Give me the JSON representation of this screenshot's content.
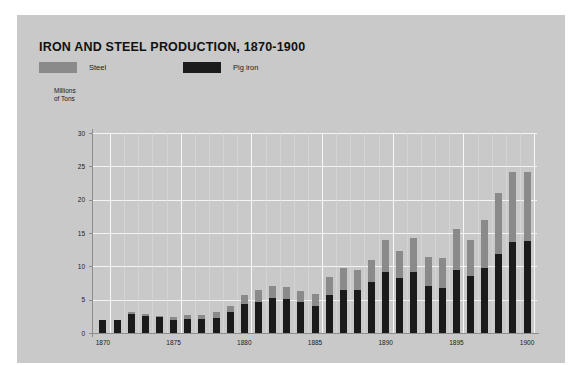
{
  "figure": {
    "background_color": "#c9c9c9",
    "page_background": "#ffffff",
    "title": "IRON AND STEEL PRODUCTION, 1870-1900"
  },
  "legend": [
    {
      "label": "Steel",
      "color": "#8a8a8a",
      "left": 0
    },
    {
      "label": "Pig iron",
      "color": "#1b1b1b",
      "left": 144
    }
  ],
  "axes": {
    "ylabel_line1": "Millions",
    "ylabel_line2": "of Tons",
    "yticks": [
      0,
      5,
      10,
      15,
      20,
      25,
      30
    ],
    "xticks": [
      1870,
      1875,
      1880,
      1885,
      1890,
      1895,
      1900
    ]
  },
  "chart_data": {
    "type": "bar",
    "title": "IRON AND STEEL PRODUCTION, 1870-1900",
    "xlabel": "",
    "ylabel": "Millions of Tons",
    "ylim": [
      0,
      30
    ],
    "xlim": [
      1869.3,
      1900.7
    ],
    "grid": true,
    "stacked": true,
    "legend_position": "top-left",
    "categories": [
      1870,
      1871,
      1872,
      1873,
      1874,
      1875,
      1876,
      1877,
      1878,
      1879,
      1880,
      1881,
      1882,
      1883,
      1884,
      1885,
      1886,
      1887,
      1888,
      1889,
      1890,
      1891,
      1892,
      1893,
      1894,
      1895,
      1896,
      1897,
      1898,
      1899,
      1900
    ],
    "series": [
      {
        "name": "Pig iron",
        "color": "#1b1b1b",
        "values": [
          1.9,
          1.9,
          2.9,
          2.6,
          2.4,
          2.0,
          2.1,
          2.1,
          2.3,
          3.1,
          4.3,
          4.6,
          5.2,
          5.1,
          4.6,
          4.1,
          5.7,
          6.4,
          6.5,
          7.6,
          9.2,
          8.3,
          9.2,
          7.1,
          6.7,
          9.4,
          8.6,
          9.7,
          11.8,
          13.6,
          13.8
        ]
      },
      {
        "name": "Steel",
        "color": "#8a8a8a",
        "values": [
          0.1,
          0.1,
          0.2,
          0.2,
          0.2,
          0.4,
          0.6,
          0.6,
          0.8,
          1.0,
          1.4,
          1.8,
          1.9,
          1.8,
          1.7,
          1.8,
          2.7,
          3.4,
          2.9,
          3.4,
          4.8,
          4.0,
          5.0,
          4.3,
          4.5,
          6.2,
          5.4,
          7.2,
          9.2,
          10.6,
          10.4
        ]
      }
    ],
    "totals": [
      2.0,
      2.0,
      3.1,
      2.8,
      2.6,
      2.4,
      2.7,
      2.7,
      3.1,
      4.1,
      5.7,
      6.4,
      7.1,
      6.9,
      6.3,
      5.9,
      8.4,
      9.8,
      9.4,
      11.0,
      14.0,
      12.3,
      14.2,
      11.4,
      11.2,
      15.6,
      14.0,
      16.9,
      21.0,
      24.2,
      24.2
    ]
  }
}
